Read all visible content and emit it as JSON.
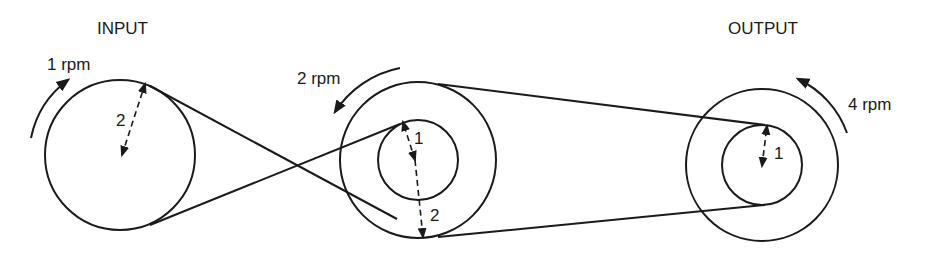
{
  "diagram": {
    "type": "belt-pulley-drive",
    "colors": {
      "line": "#1a1a1a",
      "background": "#ffffff"
    },
    "labels": {
      "input": "INPUT",
      "output": "OUTPUT"
    },
    "pulleys": [
      {
        "id": "input-pulley",
        "speed_label": "1 rpm",
        "rotation": "clockwise",
        "radii": [
          {
            "label": "2"
          }
        ]
      },
      {
        "id": "middle-compound-pulley",
        "speed_label": "2 rpm",
        "rotation": "counterclockwise",
        "radii": [
          {
            "label": "1",
            "which": "inner"
          },
          {
            "label": "2",
            "which": "outer"
          }
        ]
      },
      {
        "id": "output-compound-pulley",
        "speed_label": "4 rpm",
        "rotation": "counterclockwise",
        "radii": [
          {
            "label": "1",
            "which": "inner"
          }
        ]
      }
    ],
    "belts": [
      {
        "id": "crossed-belt",
        "from": "input-pulley",
        "to": "middle-inner",
        "kind": "crossed"
      },
      {
        "id": "open-belt",
        "from": "middle-outer",
        "to": "output-inner",
        "kind": "open"
      }
    ]
  }
}
